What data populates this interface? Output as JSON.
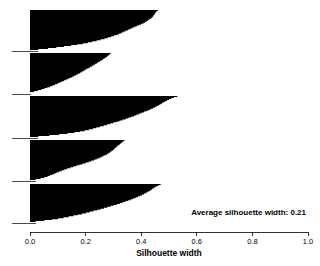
{
  "chart_data": {
    "type": "bar",
    "orientation": "horizontal",
    "title": "",
    "subtitle": "",
    "xlabel": "Silhouette width",
    "ylabel": "",
    "xlim": [
      0.0,
      1.0
    ],
    "xticks": [
      0.0,
      0.2,
      0.4,
      0.6,
      0.8,
      1.0
    ],
    "xtick_labels": [
      "0.0",
      "0.2",
      "0.4",
      "0.6",
      "0.8",
      "1.0"
    ],
    "grid": false,
    "legend": null,
    "bar_color": "#000000",
    "annotations": [
      {
        "name": "average-silhouette-width",
        "text": "Average silhouette width: 0.21",
        "value": 0.21,
        "x": 0.99,
        "y_px": 212,
        "align": "right"
      }
    ],
    "clusters": [
      {
        "name": "cluster-1",
        "index": 1,
        "n": 41,
        "top_px": 10,
        "bottom_px": 50,
        "max_width": 0.46,
        "min_width": 0.03,
        "values": [
          0.46,
          0.455,
          0.452,
          0.45,
          0.448,
          0.445,
          0.443,
          0.44,
          0.436,
          0.43,
          0.425,
          0.42,
          0.414,
          0.408,
          0.4,
          0.392,
          0.384,
          0.376,
          0.368,
          0.36,
          0.352,
          0.344,
          0.336,
          0.328,
          0.32,
          0.312,
          0.302,
          0.292,
          0.28,
          0.268,
          0.254,
          0.24,
          0.224,
          0.208,
          0.19,
          0.17,
          0.148,
          0.122,
          0.095,
          0.065,
          0.03
        ]
      },
      {
        "name": "cluster-2",
        "index": 2,
        "n": 41,
        "top_px": 53,
        "bottom_px": 93,
        "max_width": 0.29,
        "min_width": 0.0,
        "values": [
          0.29,
          0.286,
          0.282,
          0.278,
          0.273,
          0.268,
          0.263,
          0.258,
          0.252,
          0.246,
          0.24,
          0.234,
          0.228,
          0.222,
          0.216,
          0.21,
          0.204,
          0.198,
          0.192,
          0.186,
          0.18,
          0.173,
          0.166,
          0.159,
          0.152,
          0.145,
          0.138,
          0.13,
          0.122,
          0.114,
          0.106,
          0.098,
          0.09,
          0.081,
          0.072,
          0.062,
          0.052,
          0.041,
          0.029,
          0.015,
          0.0
        ]
      },
      {
        "name": "cluster-3",
        "index": 3,
        "n": 42,
        "top_px": 96,
        "bottom_px": 137,
        "max_width": 0.53,
        "min_width": 0.03,
        "values": [
          0.53,
          0.518,
          0.508,
          0.5,
          0.493,
          0.487,
          0.481,
          0.475,
          0.469,
          0.463,
          0.456,
          0.449,
          0.442,
          0.434,
          0.426,
          0.418,
          0.41,
          0.401,
          0.392,
          0.383,
          0.374,
          0.364,
          0.354,
          0.344,
          0.333,
          0.322,
          0.311,
          0.3,
          0.289,
          0.277,
          0.265,
          0.252,
          0.239,
          0.226,
          0.212,
          0.197,
          0.18,
          0.16,
          0.135,
          0.105,
          0.07,
          0.03
        ]
      },
      {
        "name": "cluster-4",
        "index": 4,
        "n": 41,
        "top_px": 140,
        "bottom_px": 180,
        "max_width": 0.34,
        "min_width": 0.02,
        "values": [
          0.34,
          0.335,
          0.33,
          0.326,
          0.322,
          0.318,
          0.314,
          0.31,
          0.306,
          0.302,
          0.298,
          0.293,
          0.288,
          0.283,
          0.277,
          0.271,
          0.264,
          0.257,
          0.249,
          0.24,
          0.231,
          0.221,
          0.211,
          0.2,
          0.189,
          0.178,
          0.167,
          0.156,
          0.145,
          0.134,
          0.124,
          0.114,
          0.105,
          0.096,
          0.088,
          0.08,
          0.072,
          0.063,
          0.052,
          0.038,
          0.02
        ]
      },
      {
        "name": "cluster-5",
        "index": 5,
        "n": 40,
        "top_px": 184,
        "bottom_px": 222,
        "max_width": 0.47,
        "min_width": 0.02,
        "values": [
          0.47,
          0.462,
          0.455,
          0.449,
          0.444,
          0.439,
          0.434,
          0.429,
          0.423,
          0.417,
          0.41,
          0.403,
          0.396,
          0.388,
          0.38,
          0.371,
          0.362,
          0.353,
          0.343,
          0.333,
          0.323,
          0.312,
          0.301,
          0.29,
          0.278,
          0.266,
          0.254,
          0.241,
          0.228,
          0.215,
          0.201,
          0.187,
          0.172,
          0.156,
          0.139,
          0.121,
          0.101,
          0.079,
          0.052,
          0.02
        ]
      }
    ]
  },
  "axis": {
    "x_title": "Silhouette width",
    "tick_labels": [
      "0.0",
      "0.2",
      "0.4",
      "0.6",
      "0.8",
      "1.0"
    ]
  },
  "annotation": {
    "average_text": "Average silhouette width: 0.21"
  }
}
